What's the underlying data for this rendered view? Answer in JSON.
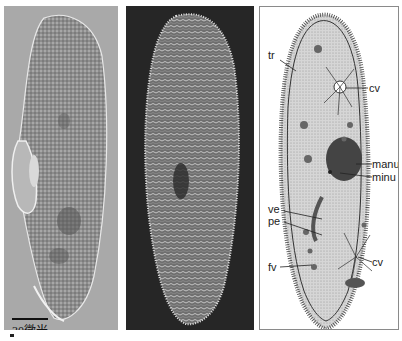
{
  "figure": {
    "panels": [
      {
        "id": "left",
        "type": "light-micrograph",
        "scale_bar_label": "30微米"
      },
      {
        "id": "middle",
        "type": "scanning-electron-micrograph"
      },
      {
        "id": "right",
        "type": "labeled-illustration"
      }
    ]
  },
  "labels": {
    "tr": "tr",
    "cv_top": "cv",
    "manu": "manu",
    "minu": "minu",
    "ve": "ve",
    "pe": "pe",
    "cv_bottom": "cv",
    "fv": "fv"
  },
  "scale_bar": {
    "label": "30微米"
  },
  "colors": {
    "left_bg": "#a9a9a9",
    "mid_bg": "#262626",
    "right_bg": "#ffffff",
    "panel_border": "#8a8a8a"
  }
}
